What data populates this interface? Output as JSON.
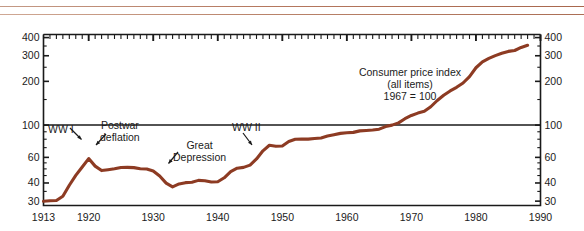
{
  "figure": {
    "decoration": {
      "rule_color_top": "#b5785f",
      "rule_color_bottom": "#b9836a"
    },
    "line_color": "#8d3b23",
    "axis_color": "#1a1a1a",
    "background": "#ffffff"
  },
  "chart_data": {
    "type": "line",
    "title": "Consumer price index",
    "subtitle": "(all items)",
    "note": "1967 = 100",
    "xlabel": "",
    "ylabel": "",
    "scale": "log",
    "xlim": [
      1913,
      1990
    ],
    "ylim": [
      28,
      420
    ],
    "grid": false,
    "legend": "none",
    "y_ticks_left": [
      "400",
      "300",
      "200",
      "100",
      "60",
      "40",
      "30"
    ],
    "y_ticks_right": [
      "400",
      "300",
      "200",
      "100",
      "60",
      "40",
      "30"
    ],
    "y_tick_values": [
      400,
      300,
      200,
      100,
      60,
      40,
      30
    ],
    "x_ticks": [
      "1913",
      "1920",
      "1930",
      "1940",
      "1950",
      "1960",
      "1970",
      "1980",
      "1990"
    ],
    "x_tick_values": [
      1913,
      1920,
      1930,
      1940,
      1950,
      1960,
      1970,
      1980,
      1990
    ],
    "series": [
      {
        "name": "Consumer price index (all items), 1967 = 100",
        "color": "#8d3b23",
        "x": [
          1913,
          1914,
          1915,
          1916,
          1917,
          1918,
          1919,
          1920,
          1921,
          1922,
          1923,
          1924,
          1925,
          1926,
          1927,
          1928,
          1929,
          1930,
          1931,
          1932,
          1933,
          1934,
          1935,
          1936,
          1937,
          1938,
          1939,
          1940,
          1941,
          1942,
          1943,
          1944,
          1945,
          1946,
          1947,
          1948,
          1949,
          1950,
          1951,
          1952,
          1953,
          1954,
          1955,
          1956,
          1957,
          1958,
          1959,
          1960,
          1961,
          1962,
          1963,
          1964,
          1965,
          1966,
          1967,
          1968,
          1969,
          1970,
          1971,
          1972,
          1973,
          1974,
          1975,
          1976,
          1977,
          1978,
          1979,
          1980,
          1981,
          1982,
          1983,
          1984,
          1985,
          1986,
          1987,
          1988
        ],
        "values": [
          29.7,
          30.1,
          30.4,
          32.7,
          38.4,
          45.1,
          51.8,
          58.4,
          52.1,
          48.8,
          49.7,
          49.8,
          51.1,
          51.5,
          50.6,
          50.0,
          50.0,
          48.7,
          44.4,
          39.9,
          37.8,
          39.1,
          40.1,
          40.6,
          42.0,
          41.2,
          40.6,
          41.0,
          43.1,
          47.8,
          50.7,
          51.6,
          52.8,
          58.5,
          66.9,
          72.1,
          71.4,
          72.1,
          77.8,
          79.5,
          80.1,
          80.5,
          80.2,
          81.4,
          84.3,
          86.6,
          87.3,
          88.7,
          89.6,
          90.6,
          91.7,
          92.9,
          94.5,
          97.2,
          100.0,
          104.2,
          109.8,
          116.3,
          121.3,
          125.3,
          133.1,
          147.7,
          161.2,
          170.5,
          181.5,
          195.4,
          217.4,
          246.8,
          272.4,
          289.1,
          298.4,
          311.1,
          322.2,
          328.4,
          340.4,
          354.3
        ],
        "annotations": [
          {
            "label": "WW I",
            "at_year": 1920,
            "at_value": 58.4
          },
          {
            "label": "Postwar deflation",
            "at_year": 1922,
            "at_value": 48.8
          },
          {
            "label": "Great Depression",
            "at_year": 1932,
            "at_value": 39.9
          },
          {
            "label": "WW II",
            "at_year": 1946,
            "at_value": 58.5
          }
        ]
      }
    ]
  },
  "annotations": {
    "ww1": "WW I",
    "postwar_line1": "Postwar",
    "postwar_line2": "deflation",
    "depression_line1": "Great",
    "depression_line2": "Depression",
    "ww2": "WW II",
    "title_line1": "Consumer price index",
    "title_line2": "(all items)",
    "title_line3": "1967 = 100"
  }
}
